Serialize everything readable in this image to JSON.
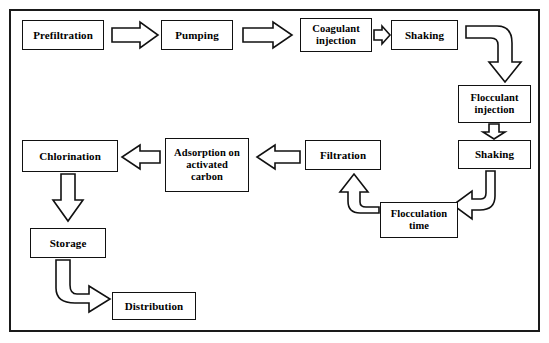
{
  "diagram": {
    "border_color": "#1a1a1a",
    "box_fill": "#ffffff",
    "line_color": "#111111",
    "nodes": [
      {
        "id": "prefiltration",
        "label": "Prefiltration"
      },
      {
        "id": "pumping",
        "label": "Pumping"
      },
      {
        "id": "coagulant",
        "label": "Coagulant injection"
      },
      {
        "id": "shaking_top",
        "label": "Shaking"
      },
      {
        "id": "flocculant",
        "label": "Flocculant injection"
      },
      {
        "id": "shaking_right",
        "label": "Shaking"
      },
      {
        "id": "flocculation",
        "label": "Flocculation time"
      },
      {
        "id": "filtration",
        "label": "Filtration"
      },
      {
        "id": "adsorption",
        "label": "Adsorption on activated carbon"
      },
      {
        "id": "chlorination",
        "label": "Chlorination"
      },
      {
        "id": "storage",
        "label": "Storage"
      },
      {
        "id": "distribution",
        "label": "Distribution"
      }
    ],
    "edges": [
      {
        "from": "prefiltration",
        "to": "pumping",
        "style": "block-arrow-right"
      },
      {
        "from": "pumping",
        "to": "coagulant",
        "style": "block-arrow-right"
      },
      {
        "from": "coagulant",
        "to": "shaking_top",
        "style": "block-arrow-right-small"
      },
      {
        "from": "shaking_top",
        "to": "flocculant",
        "style": "curved-elbow-right-down"
      },
      {
        "from": "flocculant",
        "to": "shaking_right",
        "style": "block-arrow-down"
      },
      {
        "from": "shaking_right",
        "to": "flocculation",
        "style": "curved-elbow-down-left"
      },
      {
        "from": "flocculation",
        "to": "filtration",
        "style": "curved-elbow-left-up"
      },
      {
        "from": "filtration",
        "to": "adsorption",
        "style": "block-arrow-left"
      },
      {
        "from": "adsorption",
        "to": "chlorination",
        "style": "block-arrow-left"
      },
      {
        "from": "chlorination",
        "to": "storage",
        "style": "block-arrow-down"
      },
      {
        "from": "storage",
        "to": "distribution",
        "style": "curved-elbow-down-right"
      }
    ]
  }
}
